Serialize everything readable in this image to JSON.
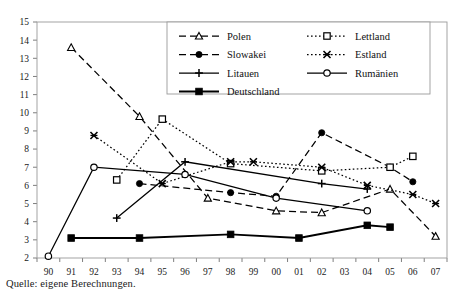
{
  "caption": "Quelle: eigene Berechnungen.",
  "chart_data": {
    "type": "line",
    "title": "",
    "xlabel": "",
    "ylabel": "",
    "ylim": [
      2,
      15
    ],
    "ytick_step": 1,
    "yticks": [
      "2",
      "3",
      "4",
      "5",
      "6",
      "7",
      "8",
      "9",
      "10",
      "11",
      "12",
      "13",
      "14",
      "15"
    ],
    "grid": false,
    "legend_position": "top-right-inside",
    "x": [
      "90",
      "91",
      "92",
      "93",
      "94",
      "95",
      "96",
      "97",
      "98",
      "99",
      "00",
      "01",
      "02",
      "03",
      "04",
      "05",
      "06",
      "07"
    ],
    "categories": [
      "90",
      "91",
      "92",
      "93",
      "94",
      "95",
      "96",
      "97",
      "98",
      "99",
      "00",
      "01",
      "02",
      "03",
      "04",
      "05",
      "06",
      "07"
    ],
    "series": [
      {
        "name": "Polen",
        "marker": "open-triangle",
        "linestyle": "dashed",
        "color": "#000000",
        "values": [
          null,
          13.6,
          null,
          null,
          9.8,
          null,
          null,
          5.3,
          null,
          null,
          4.6,
          null,
          4.5,
          null,
          null,
          5.8,
          null,
          3.2
        ]
      },
      {
        "name": "Slowakei",
        "marker": "filled-circle",
        "linestyle": "dashed",
        "color": "#000000",
        "values": [
          null,
          null,
          null,
          null,
          6.1,
          null,
          null,
          null,
          5.6,
          null,
          5.4,
          null,
          8.9,
          null,
          null,
          7.0,
          6.2,
          null
        ]
      },
      {
        "name": "Litauen",
        "marker": "plus",
        "linestyle": "solid",
        "color": "#000000",
        "values": [
          null,
          null,
          null,
          4.2,
          null,
          null,
          7.3,
          null,
          null,
          null,
          null,
          null,
          6.1,
          null,
          5.8,
          null,
          null,
          null
        ]
      },
      {
        "name": "Deutschland",
        "marker": "filled-square",
        "linestyle": "solid-thick",
        "color": "#000000",
        "values": [
          null,
          3.1,
          null,
          null,
          3.1,
          null,
          null,
          null,
          3.3,
          null,
          null,
          3.1,
          null,
          null,
          3.8,
          3.7,
          null,
          null
        ]
      },
      {
        "name": "Lettland",
        "marker": "open-square",
        "linestyle": "dotted",
        "color": "#000000",
        "values": [
          null,
          null,
          null,
          6.3,
          null,
          9.65,
          null,
          null,
          7.2,
          null,
          null,
          null,
          6.8,
          null,
          null,
          7.0,
          7.6,
          null
        ]
      },
      {
        "name": "Estland",
        "marker": "cross-x",
        "linestyle": "dotted",
        "color": "#000000",
        "values": [
          null,
          null,
          8.75,
          null,
          null,
          6.1,
          null,
          null,
          7.3,
          7.3,
          null,
          null,
          7.0,
          null,
          6.0,
          null,
          5.5,
          5.0
        ]
      },
      {
        "name": "Rumänien",
        "marker": "open-circle",
        "linestyle": "solid",
        "color": "#000000",
        "values": [
          2.1,
          null,
          7.0,
          null,
          null,
          null,
          6.6,
          null,
          null,
          null,
          5.3,
          null,
          null,
          null,
          4.6,
          null,
          null,
          null
        ]
      }
    ],
    "legend": [
      {
        "label": "Polen",
        "marker": "open-triangle",
        "linestyle": "dashed"
      },
      {
        "label": "Lettland",
        "marker": "open-square",
        "linestyle": "dotted"
      },
      {
        "label": "Slowakei",
        "marker": "filled-circle",
        "linestyle": "dashed"
      },
      {
        "label": "Estland",
        "marker": "cross-x",
        "linestyle": "dotted"
      },
      {
        "label": "Litauen",
        "marker": "plus",
        "linestyle": "solid"
      },
      {
        "label": "Rumänien",
        "marker": "open-circle",
        "linestyle": "solid"
      },
      {
        "label": "Deutschland",
        "marker": "filled-square",
        "linestyle": "solid-thick"
      }
    ]
  }
}
